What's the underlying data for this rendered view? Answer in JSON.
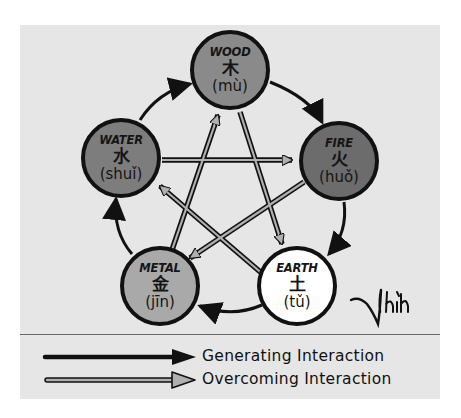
{
  "diagram": {
    "colors": {
      "background": "#e6e6e6",
      "wood": "#8a8a8a",
      "fire": "#6c6c6c",
      "water": "#7d7d7d",
      "metal": "#a9a9a9",
      "earth": "#ffffff",
      "stroke": "#111111",
      "overcoming_fill": "#b0b0b0"
    },
    "nodes": [
      {
        "id": "wood",
        "name": "WOOD",
        "hanzi": "木",
        "pinyin": "(mù)"
      },
      {
        "id": "fire",
        "name": "FIRE",
        "hanzi": "火",
        "pinyin": "(huǒ)"
      },
      {
        "id": "earth",
        "name": "EARTH",
        "hanzi": "土",
        "pinyin": "(tǔ)"
      },
      {
        "id": "metal",
        "name": "METAL",
        "hanzi": "金",
        "pinyin": "(jīn)"
      },
      {
        "id": "water",
        "name": "WATER",
        "hanzi": "水",
        "pinyin": "(shuǐ)"
      }
    ],
    "generating_edges": [
      {
        "from": "wood",
        "to": "fire"
      },
      {
        "from": "fire",
        "to": "earth"
      },
      {
        "from": "earth",
        "to": "metal"
      },
      {
        "from": "metal",
        "to": "water"
      },
      {
        "from": "water",
        "to": "wood"
      }
    ],
    "overcoming_edges": [
      {
        "from": "wood",
        "to": "earth"
      },
      {
        "from": "earth",
        "to": "water"
      },
      {
        "from": "water",
        "to": "fire"
      },
      {
        "from": "fire",
        "to": "metal"
      },
      {
        "from": "metal",
        "to": "wood"
      }
    ],
    "signature": "Thích"
  },
  "legend": {
    "generating_label": "Generating Interaction",
    "overcoming_label": "Overcoming Interaction"
  }
}
